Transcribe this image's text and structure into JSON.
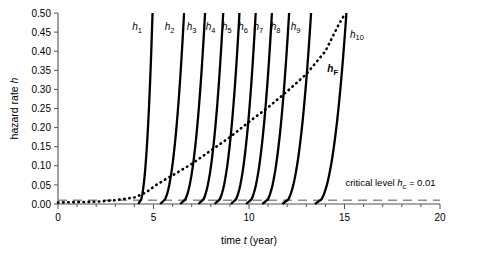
{
  "chart_data": {
    "type": "line",
    "title": "",
    "xlabel": "time t (year)",
    "ylabel": "hazard rate h",
    "xlim": [
      0,
      20
    ],
    "ylim": [
      0,
      0.5
    ],
    "xticks": [
      0,
      5,
      10,
      15,
      20
    ],
    "xtick_labels": [
      "0",
      "5",
      "10",
      "15",
      "20"
    ],
    "xtick_minor_step": 1,
    "yticks": [
      0.0,
      0.05,
      0.1,
      0.15,
      0.2,
      0.25,
      0.3,
      0.35,
      0.4,
      0.45,
      0.5
    ],
    "ytick_labels": [
      "0.00",
      "0.05",
      "0.10",
      "0.15",
      "0.20",
      "0.25",
      "0.30",
      "0.35",
      "0.40",
      "0.45",
      "0.50"
    ],
    "grid": false,
    "legend_position": "inline-labels",
    "series": [
      {
        "name": "h1",
        "label": "h",
        "sub": "1",
        "style": "solid-bold",
        "color": "#000000",
        "onset_x": 4.2,
        "x_at_top": 4.95,
        "label_x": 4.2,
        "label_y": 0.455
      },
      {
        "name": "h2",
        "label": "h",
        "sub": "2",
        "style": "solid-bold",
        "color": "#000000",
        "onset_x": 5.35,
        "x_at_top": 6.6,
        "label_x": 5.9,
        "label_y": 0.455
      },
      {
        "name": "h3",
        "label": "h",
        "sub": "3",
        "style": "solid-bold",
        "color": "#000000",
        "onset_x": 6.4,
        "x_at_top": 7.7,
        "label_x": 7.05,
        "label_y": 0.455
      },
      {
        "name": "h4",
        "label": "h",
        "sub": "4",
        "style": "solid-bold",
        "color": "#000000",
        "onset_x": 7.35,
        "x_at_top": 8.65,
        "label_x": 8.05,
        "label_y": 0.455
      },
      {
        "name": "h5",
        "label": "h",
        "sub": "5",
        "style": "solid-bold",
        "color": "#000000",
        "onset_x": 8.2,
        "x_at_top": 9.5,
        "label_x": 8.9,
        "label_y": 0.455
      },
      {
        "name": "h6",
        "label": "h",
        "sub": "6",
        "style": "solid-bold",
        "color": "#000000",
        "onset_x": 9.05,
        "x_at_top": 10.35,
        "label_x": 9.75,
        "label_y": 0.455
      },
      {
        "name": "h7",
        "label": "h",
        "sub": "7",
        "style": "solid-bold",
        "color": "#000000",
        "onset_x": 9.85,
        "x_at_top": 11.2,
        "label_x": 10.55,
        "label_y": 0.455
      },
      {
        "name": "h8",
        "label": "h",
        "sub": "8",
        "style": "solid-bold",
        "color": "#000000",
        "onset_x": 10.7,
        "x_at_top": 12.1,
        "label_x": 11.45,
        "label_y": 0.455
      },
      {
        "name": "h9",
        "label": "h",
        "sub": "9",
        "style": "solid-bold",
        "color": "#000000",
        "onset_x": 11.75,
        "x_at_top": 13.25,
        "label_x": 12.5,
        "label_y": 0.455
      },
      {
        "name": "h10",
        "label": "h",
        "sub": "10",
        "style": "solid-bold",
        "color": "#000000",
        "onset_x": 13.45,
        "x_at_top": 15.1,
        "label_x": 15.6,
        "label_y": 0.435
      }
    ],
    "envelope": {
      "name": "hF",
      "label": "h",
      "sub": "F",
      "style": "dotted-bold",
      "color": "#000000",
      "label_x": 14.1,
      "label_y": 0.345,
      "points": [
        {
          "x": 0.0,
          "y": 0.004
        },
        {
          "x": 1.0,
          "y": 0.005
        },
        {
          "x": 2.0,
          "y": 0.006
        },
        {
          "x": 3.0,
          "y": 0.01
        },
        {
          "x": 4.0,
          "y": 0.017
        },
        {
          "x": 4.6,
          "y": 0.03
        },
        {
          "x": 5.2,
          "y": 0.052
        },
        {
          "x": 6.0,
          "y": 0.075
        },
        {
          "x": 7.0,
          "y": 0.105
        },
        {
          "x": 8.0,
          "y": 0.14
        },
        {
          "x": 9.0,
          "y": 0.175
        },
        {
          "x": 10.0,
          "y": 0.215
        },
        {
          "x": 11.0,
          "y": 0.253
        },
        {
          "x": 12.0,
          "y": 0.295
        },
        {
          "x": 13.0,
          "y": 0.34
        },
        {
          "x": 14.0,
          "y": 0.4
        },
        {
          "x": 14.7,
          "y": 0.47
        },
        {
          "x": 15.05,
          "y": 0.5
        }
      ]
    },
    "critical_level": {
      "value": 0.01,
      "style": "dashed",
      "color": "#8c8c8c",
      "label_prefix": "critical level ",
      "label_symbol": "h",
      "label_sub": "c",
      "label_suffix": " = 0.01",
      "label_x": 15.05,
      "label_y": 0.047
    }
  }
}
